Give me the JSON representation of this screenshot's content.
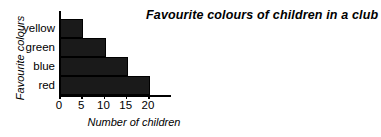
{
  "chart_data": {
    "type": "bar",
    "orientation": "horizontal",
    "title": "Favourite colours of children in a club",
    "xlabel": "Number of children",
    "ylabel": "Favourite colours",
    "categories": [
      "yellow",
      "green",
      "blue",
      "red"
    ],
    "values": [
      5,
      10,
      15,
      20
    ],
    "xticks": [
      0,
      5,
      10,
      15,
      20
    ],
    "xtick_labels": [
      "0",
      "5",
      "10",
      "15",
      "20"
    ],
    "xlim": [
      0,
      20
    ],
    "grid": false,
    "legend": "none",
    "bar_color": "#1a1a1a",
    "axis_color": "#000000",
    "background": "#ffffff"
  }
}
